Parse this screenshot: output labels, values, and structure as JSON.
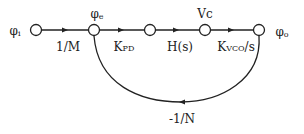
{
  "diagram": {
    "type": "signal-flow-graph",
    "colors": {
      "stroke": "#222222",
      "background": "#ffffff"
    },
    "nodes": [
      {
        "id": "phi_i",
        "label": "φ",
        "sub": "i",
        "x": 36,
        "y": 30
      },
      {
        "id": "phi_e",
        "label": "φ",
        "sub": "e",
        "x": 94,
        "y": 30
      },
      {
        "id": "n3",
        "label": "",
        "x": 150,
        "y": 30
      },
      {
        "id": "vc",
        "label": "Vc",
        "x": 205,
        "y": 30
      },
      {
        "id": "phi_o",
        "label": "φ",
        "sub": "o",
        "x": 259,
        "y": 30
      }
    ],
    "branches": [
      {
        "from": "phi_i",
        "to": "phi_e",
        "gain": "1/M"
      },
      {
        "from": "phi_e",
        "to": "n3",
        "gain_main": "K",
        "gain_sub": "PD"
      },
      {
        "from": "n3",
        "to": "vc",
        "gain": "H(s)"
      },
      {
        "from": "vc",
        "to": "phi_o",
        "gain_main": "K",
        "gain_sub": "VCO",
        "gain_tail": "/s"
      },
      {
        "from": "phi_o",
        "to": "phi_e",
        "gain": "-1/N",
        "feedback": true
      }
    ]
  }
}
